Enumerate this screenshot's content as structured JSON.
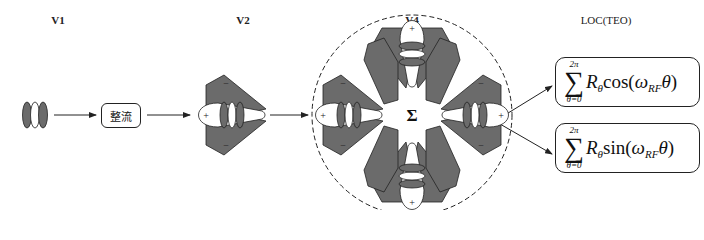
{
  "stages": {
    "v1": {
      "label": "V1"
    },
    "v2": {
      "label": "V2"
    },
    "v4": {
      "label": "V4",
      "center_symbol": "Σ"
    },
    "loc": {
      "label": "LOC(TEO)"
    }
  },
  "rectifier": {
    "label": "整流"
  },
  "signs": {
    "plus": "+",
    "minus": "−"
  },
  "formulas": [
    {
      "upper": "2π",
      "lower": "θ=0",
      "var": "R",
      "var_sub": "θ",
      "func": "cos",
      "omega": "ω",
      "omega_sub": "RF",
      "theta": "θ"
    },
    {
      "upper": "2π",
      "lower": "θ=0",
      "var": "R",
      "var_sub": "θ",
      "func": "sin",
      "omega": "ω",
      "omega_sub": "RF",
      "theta": "θ"
    }
  ],
  "colors": {
    "lobe_fill": "#6b6b6b",
    "stroke": "#222222",
    "background": "#ffffff"
  }
}
